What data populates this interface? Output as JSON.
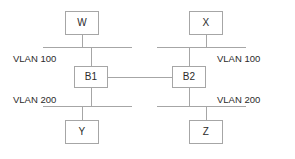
{
  "diagram": {
    "type": "network-diagram",
    "colors": {
      "line": "#a6a6a6",
      "node_border": "#a6a6a6",
      "node_fill": "#ffffff",
      "text": "#2b2b2b",
      "background": "#ffffff"
    },
    "nodes": [
      {
        "id": "W",
        "label": "W",
        "role": "host",
        "x": 65,
        "y": 11,
        "w": 34,
        "h": 24
      },
      {
        "id": "X",
        "label": "X",
        "role": "host",
        "x": 189,
        "y": 11,
        "w": 34,
        "h": 24
      },
      {
        "id": "B1",
        "label": "B1",
        "role": "bridge",
        "x": 74,
        "y": 66,
        "w": 34,
        "h": 22
      },
      {
        "id": "B2",
        "label": "B2",
        "role": "bridge",
        "x": 172,
        "y": 66,
        "w": 34,
        "h": 22
      },
      {
        "id": "Y",
        "label": "Y",
        "role": "host",
        "x": 65,
        "y": 120,
        "w": 34,
        "h": 24
      },
      {
        "id": "Z",
        "label": "Z",
        "role": "host",
        "x": 189,
        "y": 120,
        "w": 34,
        "h": 24
      }
    ],
    "segments": [
      {
        "id": "vlan100-left",
        "label": "VLAN 100",
        "label_x": 13,
        "label_y": 54,
        "bus_x": 43,
        "bus_y": 47,
        "bus_w": 89
      },
      {
        "id": "vlan100-right",
        "label": "VLAN 100",
        "label_x": 217,
        "label_y": 54,
        "bus_x": 157,
        "bus_y": 47,
        "bus_w": 89
      },
      {
        "id": "vlan200-left",
        "label": "VLAN 200",
        "label_x": 13,
        "label_y": 95,
        "bus_x": 43,
        "bus_y": 106,
        "bus_w": 89
      },
      {
        "id": "vlan200-right",
        "label": "VLAN 200",
        "label_x": 217,
        "label_y": 95,
        "bus_x": 157,
        "bus_y": 106,
        "bus_w": 89
      }
    ],
    "links": [
      {
        "id": "w-to-vlan100-left",
        "orient": "v",
        "x": 82,
        "y": 35,
        "len": 13
      },
      {
        "id": "vlan100-left-to-b1",
        "orient": "v",
        "x": 91,
        "y": 47,
        "len": 19
      },
      {
        "id": "b1-to-vlan200-left",
        "orient": "v",
        "x": 91,
        "y": 88,
        "len": 19
      },
      {
        "id": "vlan200-left-to-y",
        "orient": "v",
        "x": 82,
        "y": 106,
        "len": 14
      },
      {
        "id": "x-to-vlan100-right",
        "orient": "v",
        "x": 206,
        "y": 35,
        "len": 13
      },
      {
        "id": "vlan100-right-to-b2",
        "orient": "v",
        "x": 189,
        "y": 47,
        "len": 19
      },
      {
        "id": "b2-to-vlan200-right",
        "orient": "v",
        "x": 189,
        "y": 88,
        "len": 19
      },
      {
        "id": "vlan200-right-to-z",
        "orient": "v",
        "x": 206,
        "y": 106,
        "len": 14
      },
      {
        "id": "b1-to-b2-trunk",
        "orient": "h",
        "x": 108,
        "y": 77,
        "len": 64
      }
    ]
  }
}
